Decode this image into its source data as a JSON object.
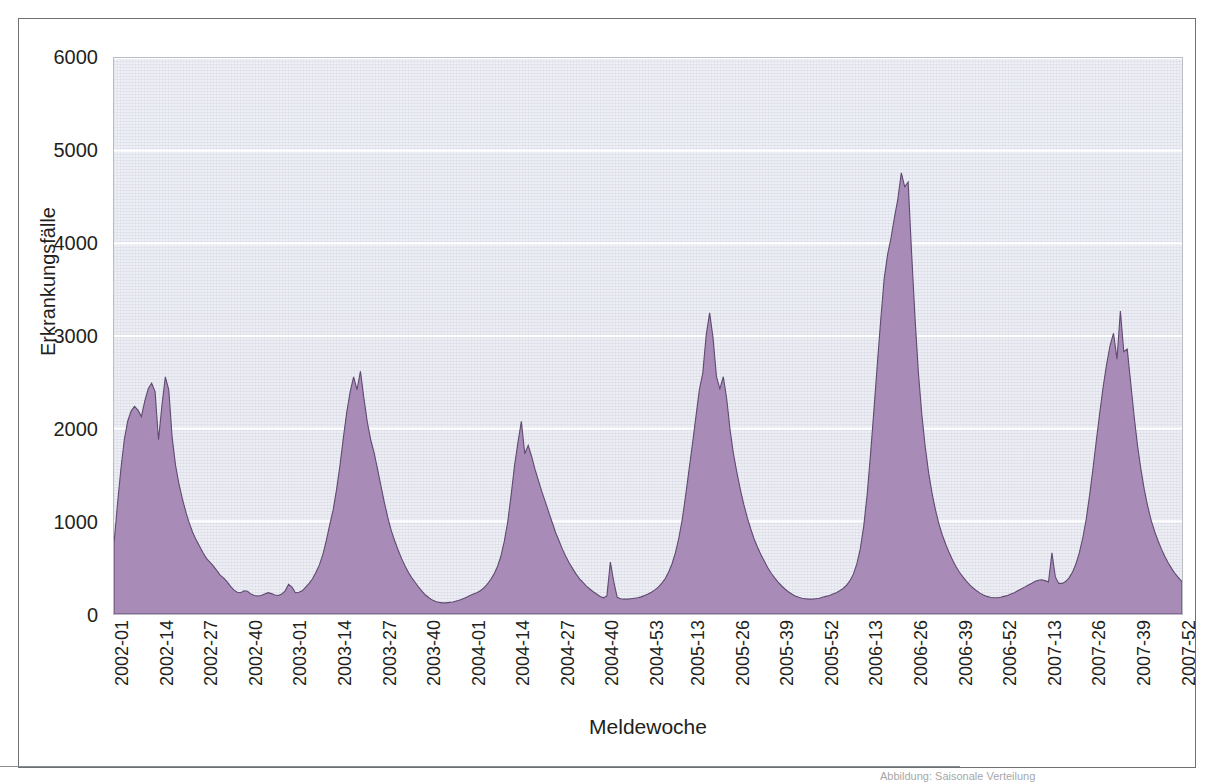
{
  "figure": {
    "axis_color": "#231f20",
    "series_fill": "#a98bb8",
    "series_stroke": "#5f4a70",
    "plot_background": "#edeff5",
    "gridline_color": "#ffffff",
    "footnote": "Abbildung: Saisonale Verteilung"
  },
  "chart_data": {
    "type": "area",
    "title": "",
    "subtitle": "",
    "xlabel": "Meldewoche",
    "ylabel": "Erkrankungsfälle",
    "ylim": [
      0,
      6000
    ],
    "ytick_values": [
      0,
      1000,
      2000,
      3000,
      4000,
      5000,
      6000
    ],
    "ytick_labels": [
      "0",
      "1000",
      "2000",
      "3000",
      "4000",
      "5000",
      "6000"
    ],
    "grid": "horizontal",
    "legend": "none",
    "xtick_labels": [
      "2002-01",
      "2002-14",
      "2002-27",
      "2002-40",
      "2003-01",
      "2003-14",
      "2003-27",
      "2003-40",
      "2004-01",
      "2004-14",
      "2004-27",
      "2004-40",
      "2004-53",
      "2005-13",
      "2005-26",
      "2005-39",
      "2005-52",
      "2006-13",
      "2006-26",
      "2006-39",
      "2006-52",
      "2007-13",
      "2007-26",
      "2007-39",
      "2007-52"
    ],
    "xtick_indices": [
      0,
      13,
      26,
      39,
      52,
      65,
      78,
      91,
      104,
      117,
      130,
      143,
      156,
      168,
      181,
      194,
      207,
      220,
      233,
      246,
      259,
      272,
      285,
      298,
      311
    ],
    "x_count": 313,
    "series": [
      {
        "name": "Erkrankungsfälle",
        "values": [
          760,
          1180,
          1560,
          1880,
          2080,
          2190,
          2240,
          2200,
          2130,
          2300,
          2430,
          2490,
          2400,
          1880,
          2250,
          2560,
          2420,
          1900,
          1600,
          1400,
          1240,
          1100,
          980,
          880,
          800,
          730,
          660,
          600,
          560,
          520,
          470,
          420,
          390,
          350,
          300,
          260,
          235,
          230,
          250,
          245,
          215,
          200,
          195,
          200,
          215,
          230,
          220,
          205,
          200,
          215,
          250,
          320,
          290,
          230,
          235,
          250,
          290,
          330,
          380,
          450,
          530,
          640,
          790,
          960,
          1120,
          1340,
          1600,
          1900,
          2180,
          2400,
          2560,
          2420,
          2620,
          2330,
          2070,
          1880,
          1740,
          1560,
          1380,
          1200,
          1040,
          900,
          790,
          690,
          600,
          520,
          450,
          390,
          340,
          290,
          245,
          205,
          175,
          150,
          135,
          125,
          120,
          120,
          125,
          130,
          140,
          150,
          165,
          180,
          200,
          215,
          230,
          250,
          280,
          320,
          370,
          430,
          510,
          620,
          780,
          990,
          1280,
          1600,
          1850,
          2080,
          1730,
          1820,
          1700,
          1560,
          1440,
          1320,
          1210,
          1100,
          990,
          880,
          790,
          700,
          620,
          550,
          490,
          430,
          380,
          340,
          300,
          270,
          240,
          215,
          190,
          175,
          195,
          560,
          350,
          180,
          165,
          160,
          160,
          165,
          170,
          175,
          185,
          200,
          215,
          235,
          260,
          290,
          330,
          380,
          450,
          540,
          660,
          820,
          1020,
          1280,
          1560,
          1840,
          2130,
          2420,
          2600,
          3010,
          3250,
          2980,
          2560,
          2430,
          2560,
          2320,
          1980,
          1720,
          1520,
          1340,
          1180,
          1040,
          920,
          810,
          720,
          640,
          570,
          500,
          440,
          390,
          345,
          305,
          270,
          240,
          215,
          195,
          180,
          170,
          165,
          160,
          160,
          165,
          170,
          180,
          190,
          200,
          215,
          230,
          250,
          275,
          310,
          360,
          430,
          540,
          700,
          940,
          1280,
          1720,
          2200,
          2700,
          3180,
          3620,
          3880,
          4060,
          4280,
          4480,
          4760,
          4610,
          4660,
          3900,
          3200,
          2600,
          2150,
          1800,
          1520,
          1300,
          1120,
          970,
          850,
          750,
          660,
          580,
          510,
          450,
          400,
          355,
          315,
          280,
          250,
          225,
          205,
          190,
          180,
          175,
          175,
          180,
          190,
          200,
          215,
          230,
          250,
          270,
          290,
          310,
          330,
          350,
          365,
          370,
          360,
          345,
          660,
          400,
          330,
          330,
          350,
          390,
          450,
          540,
          660,
          820,
          1020,
          1280,
          1570,
          1880,
          2180,
          2460,
          2700,
          2900,
          3030,
          2750,
          3270,
          2830,
          2860,
          2500,
          2140,
          1820,
          1560,
          1340,
          1160,
          1010,
          890,
          790,
          700,
          620,
          550,
          490,
          435,
          390,
          350,
          320,
          300,
          290,
          290,
          300,
          320,
          350,
          390,
          440,
          500,
          570,
          650,
          740,
          840,
          960,
          1100,
          920,
          1070,
          1290
        ]
      }
    ]
  }
}
